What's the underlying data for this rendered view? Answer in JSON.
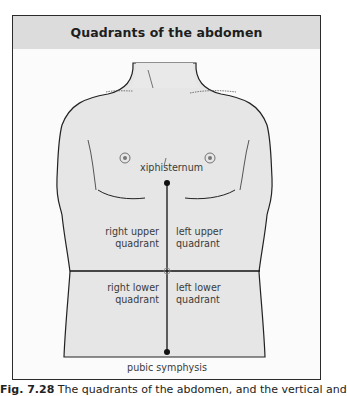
{
  "figure": {
    "title": "Quadrants of the abdomen",
    "labels": {
      "top_landmark": "xiphisternum",
      "bottom_landmark": "pubic symphysis",
      "right_upper_1": "right upper",
      "right_upper_2": "quadrant",
      "left_upper_1": "left upper",
      "left_upper_2": "quadrant",
      "right_lower_1": "right lower",
      "right_lower_2": "quadrant",
      "left_lower_1": "left lower",
      "left_lower_2": "quadrant"
    },
    "colors": {
      "header_bg": "#dcdcdc",
      "skin": "#e6e6e6",
      "outline": "#222222",
      "frame": "#2b2b2b"
    }
  },
  "caption": {
    "number": "Fig. 7.28",
    "text": "The quadrants of the abdomen, and the vertical and"
  }
}
